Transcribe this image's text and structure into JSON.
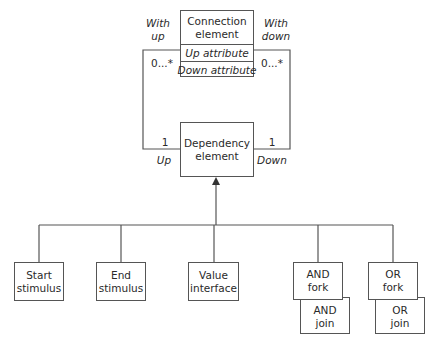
{
  "connection_element": {
    "title_line1": "Connection",
    "title_line2": "element",
    "attributes": [
      "Up attribute",
      "Down attribute"
    ]
  },
  "dependency_element": {
    "line1": "Dependency",
    "line2": "element"
  },
  "associations": {
    "left": {
      "role_top_line1": "With",
      "role_top_line2": "up",
      "multiplicity_top": "0...*",
      "multiplicity_bottom": "1",
      "role_bottom": "Up"
    },
    "right": {
      "role_top_line1": "With",
      "role_top_line2": "down",
      "multiplicity_top": "0...*",
      "multiplicity_bottom": "1",
      "role_bottom": "Down"
    }
  },
  "subtypes": [
    {
      "line1": "Start",
      "line2": "stimulus"
    },
    {
      "line1": "End",
      "line2": "stimulus"
    },
    {
      "line1": "Value",
      "line2": "interface"
    },
    {
      "line1": "AND",
      "line2": "fork"
    },
    {
      "line1": "OR",
      "line2": "fork"
    }
  ],
  "overlay_boxes": [
    {
      "line1": "AND",
      "line2": "join"
    },
    {
      "line1": "OR",
      "line2": "join"
    }
  ]
}
